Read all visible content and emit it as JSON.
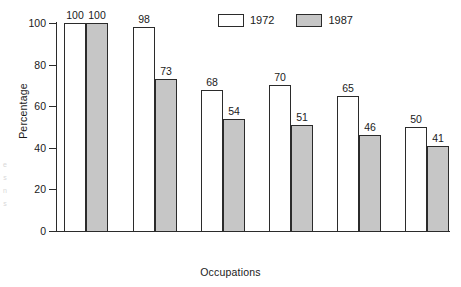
{
  "chart_data": {
    "type": "bar",
    "title": "",
    "subtitle": "",
    "xlabel": "Occupations",
    "ylabel": "Percentage",
    "ylim": [
      0,
      100
    ],
    "yticks": [
      0,
      20,
      40,
      60,
      80,
      100
    ],
    "grid": false,
    "legend_position": "top-center",
    "categories": [
      "Professional\n& Technical",
      "Craft\nWorkers",
      "Clerical\nWorkers",
      "Laborers",
      "Retail\nSales",
      "Health\nAides"
    ],
    "series": [
      {
        "name": "1972",
        "color": "#ffffff",
        "values": [
          100,
          98,
          68,
          70,
          65,
          50
        ]
      },
      {
        "name": "1987",
        "color": "#c6c6c6",
        "values": [
          100,
          73,
          54,
          51,
          46,
          41
        ]
      }
    ],
    "value_labels_shown": true,
    "axis_color": "#2b2b2b",
    "bar_outline_color": "#2b2b2b"
  },
  "artifact": {
    "edge_text": "e\ns\nn\ns"
  }
}
